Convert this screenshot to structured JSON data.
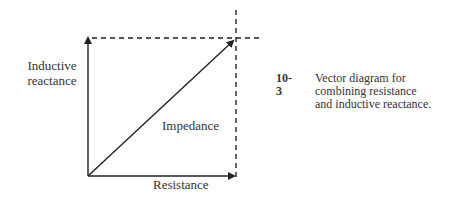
{
  "figure": {
    "number": "10-3",
    "caption": "Vector diagram for combining resistance and inductive reactance.",
    "caption_lines": [
      "Vector diagram for",
      "combining resistance",
      "and inductive reactance."
    ]
  },
  "diagram": {
    "labels": {
      "vertical_axis": "Inductive reactance",
      "vertical_axis_line1": "Inductive",
      "vertical_axis_line2": "reactance",
      "resultant": "Impedance",
      "horizontal_axis": "Resistance"
    },
    "vectors": [
      {
        "name": "resistance",
        "from": [
          0,
          0
        ],
        "to": [
          1,
          0
        ],
        "style": "solid-arrow"
      },
      {
        "name": "inductive-reactance",
        "from": [
          0,
          0
        ],
        "to": [
          0,
          1
        ],
        "style": "solid-arrow"
      },
      {
        "name": "impedance",
        "from": [
          0,
          0
        ],
        "to": [
          1,
          1
        ],
        "style": "solid-arrow"
      }
    ],
    "guides": [
      {
        "name": "horizontal-projection",
        "style": "dashed"
      },
      {
        "name": "vertical-projection",
        "style": "dashed"
      }
    ],
    "colors": {
      "line": "#222222",
      "text": "#333333",
      "background": "#ffffff"
    }
  }
}
